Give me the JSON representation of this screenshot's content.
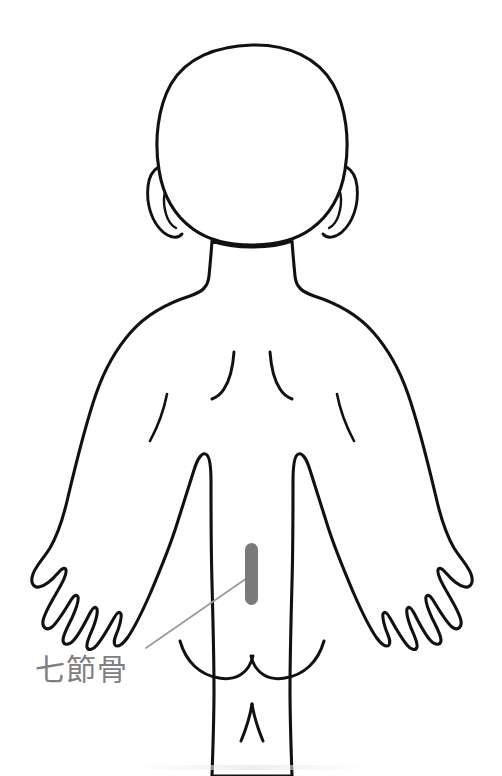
{
  "diagram": {
    "title": "七節骨",
    "view": "infant back (posterior) acupoint chart",
    "background_color": "#ffffff",
    "outline_color": "#111111",
    "annotation": {
      "label": "七節骨",
      "label_color": "#808080",
      "label_x": 35,
      "label_y": 680,
      "leader_color": "#9b9b9b",
      "leader_from_x": 146,
      "leader_from_y": 648,
      "leader_to_x": 247,
      "leader_to_y": 578
    },
    "marker": {
      "name": "七節骨",
      "shape": "vertical-rounded-bar",
      "color": "#7a7a7a",
      "x": 245,
      "y": 543,
      "width": 13,
      "height": 62
    },
    "body_parts": {
      "head": "head",
      "ear_left": "left ear",
      "ear_right": "right ear",
      "neck": "neck",
      "torso": "back / torso",
      "arm_left": "left arm",
      "arm_right": "right arm",
      "hand_left": "left hand",
      "hand_right": "right hand",
      "buttocks": "buttocks",
      "legs": "legs",
      "scapula_left": "left shoulder blade crease",
      "scapula_right": "right shoulder blade crease"
    }
  }
}
